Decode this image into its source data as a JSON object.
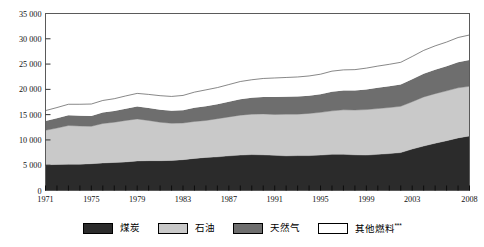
{
  "chart_data": {
    "type": "area",
    "stacked": true,
    "title": "",
    "subtitle": "",
    "xlabel": "",
    "ylabel": "",
    "grid": false,
    "legend_position": "bottom",
    "ylim": [
      0,
      35000
    ],
    "yticks": [
      0,
      5000,
      10000,
      15000,
      20000,
      25000,
      30000,
      35000
    ],
    "ytick_labels": [
      "0",
      "5 000",
      "10 000",
      "15 000",
      "20 000",
      "25 000",
      "30 000",
      "35 000"
    ],
    "xlim": [
      1971,
      2008
    ],
    "xticks": [
      1971,
      1975,
      1979,
      1983,
      1987,
      1991,
      1995,
      1999,
      2003,
      2008
    ],
    "xtick_labels": [
      "1971",
      "1975",
      "1979",
      "1983",
      "1987",
      "1991",
      "1995",
      "1999",
      "2003",
      "2008"
    ],
    "x": [
      1971,
      1972,
      1973,
      1974,
      1975,
      1976,
      1977,
      1978,
      1979,
      1980,
      1981,
      1982,
      1983,
      1984,
      1985,
      1986,
      1987,
      1988,
      1989,
      1990,
      1991,
      1992,
      1993,
      1994,
      1995,
      1996,
      1997,
      1998,
      1999,
      2000,
      2001,
      2002,
      2003,
      2004,
      2005,
      2006,
      2007,
      2008
    ],
    "series": [
      {
        "name": "煤炭",
        "color": "#2b2b2b",
        "values": [
          5100,
          5150,
          5200,
          5200,
          5300,
          5450,
          5550,
          5650,
          5850,
          5900,
          5900,
          5950,
          6100,
          6350,
          6550,
          6650,
          6850,
          7000,
          7100,
          7050,
          6950,
          6850,
          6900,
          6900,
          7000,
          7150,
          7150,
          7050,
          7000,
          7150,
          7300,
          7500,
          8200,
          8800,
          9350,
          9850,
          10400,
          10800
        ]
      },
      {
        "name": "石油",
        "color": "#c9c9c9",
        "values": [
          6800,
          7200,
          7650,
          7550,
          7400,
          7800,
          7950,
          8200,
          8300,
          7950,
          7600,
          7350,
          7250,
          7300,
          7300,
          7550,
          7700,
          7900,
          8000,
          8100,
          8100,
          8250,
          8200,
          8350,
          8450,
          8600,
          8800,
          8850,
          9000,
          9050,
          9100,
          9150,
          9350,
          9700,
          9800,
          9850,
          9900,
          9800
        ]
      },
      {
        "name": "天然气",
        "color": "#6e6e6e",
        "values": [
          1850,
          1950,
          2050,
          2050,
          2050,
          2150,
          2200,
          2300,
          2450,
          2450,
          2450,
          2450,
          2500,
          2700,
          2800,
          2850,
          3000,
          3150,
          3250,
          3350,
          3450,
          3450,
          3500,
          3500,
          3600,
          3800,
          3800,
          3850,
          3950,
          4100,
          4200,
          4300,
          4450,
          4600,
          4750,
          4850,
          5050,
          5200
        ]
      },
      {
        "name": "其他燃料***",
        "color": "#ffffff",
        "values": [
          2050,
          2100,
          2150,
          2250,
          2350,
          2400,
          2450,
          2550,
          2600,
          2700,
          2800,
          2850,
          2950,
          3100,
          3250,
          3300,
          3400,
          3500,
          3550,
          3650,
          3750,
          3800,
          3850,
          3900,
          3950,
          4050,
          4100,
          4150,
          4250,
          4300,
          4350,
          4400,
          4500,
          4600,
          4700,
          4800,
          4900,
          4950
        ]
      }
    ],
    "totals": [
      15800,
      16400,
      17050,
      17050,
      17100,
      17800,
      18150,
      18700,
      19200,
      19000,
      18750,
      18600,
      18800,
      19450,
      19900,
      20350,
      20950,
      21550,
      21900,
      22150,
      22250,
      22350,
      22450,
      22650,
      23000,
      23600,
      23850,
      23900,
      24200,
      24600,
      24950,
      25350,
      26500,
      27700,
      28600,
      29350,
      30250,
      30750
    ]
  },
  "legend": {
    "items": [
      {
        "label": "煤炭",
        "color": "#2b2b2b"
      },
      {
        "label": "石油",
        "color": "#c9c9c9"
      },
      {
        "label": "天然气",
        "color": "#6e6e6e"
      },
      {
        "label": "其他燃料",
        "sup": "***",
        "color": "#ffffff"
      }
    ]
  }
}
